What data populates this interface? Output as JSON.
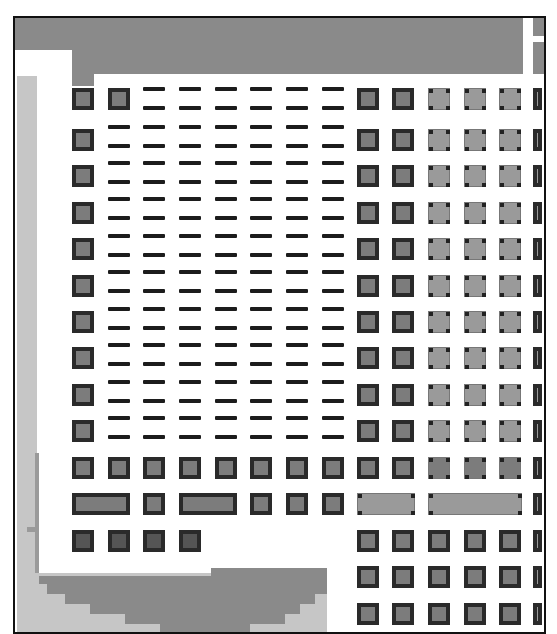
{
  "figure": {
    "frame": {
      "x": 13,
      "y": 16,
      "width": 531,
      "height": 616,
      "border_color": "#111111"
    },
    "colors": {
      "dark_band": "#8a8a8a",
      "light_band": "#c6c6c6",
      "dash": "#1c1c1c",
      "pad_dark_border": "#2a2a2a",
      "pad_fill_mid": "#7c7c7c",
      "pad_fill_light": "#9a9a9a",
      "background": "#ffffff"
    },
    "grid": {
      "left_column_x": 72,
      "dash_columns_x": [
        108,
        143,
        179,
        215,
        250,
        286,
        322
      ],
      "right_columns_x": [
        357,
        392,
        428,
        464,
        499
      ],
      "edge_column_x": 533,
      "square_rows_y": [
        88,
        129,
        165,
        202,
        238,
        275,
        311,
        347,
        384,
        420,
        457,
        493,
        530,
        566,
        603
      ],
      "dash_row_pairs_top_y": [
        87,
        125,
        161,
        197,
        234,
        270,
        307,
        343,
        380,
        416
      ],
      "dash_pair_gap": 19
    },
    "special_rows": {
      "row_457": "full row of 8 dark pads on left + 5 right pads",
      "row_493": {
        "left_blocks": [
          {
            "x": 72,
            "w": 58
          },
          {
            "x": 143,
            "w": 22
          },
          {
            "x": 179,
            "w": 58
          },
          {
            "x": 250,
            "w": 22
          },
          {
            "x": 286,
            "w": 22
          },
          {
            "x": 322,
            "w": 22
          }
        ],
        "right_blocks": [
          {
            "x": 357,
            "w": 58
          },
          {
            "x": 428,
            "w": 94
          }
        ]
      },
      "row_530": "4 dark pads on left (x 72-200), 5 right pads",
      "row_566": "5 right pads only",
      "row_603": "5 right pads only"
    }
  }
}
